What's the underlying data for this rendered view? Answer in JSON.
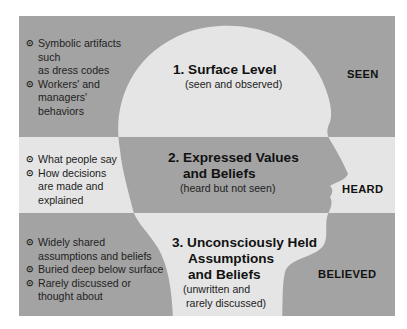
{
  "colors": {
    "dark": "#a3a3a3",
    "light": "#e5e5e5",
    "background": "#ffffff"
  },
  "bullet_icon": "⊙",
  "levels": [
    {
      "title_lines": [
        "1. Surface Level"
      ],
      "subtitle_lines": [
        "(seen and observed)"
      ],
      "tag": "SEEN",
      "bullets": [
        [
          "Symbolic artifacts such",
          "as dress codes"
        ],
        [
          "Workers' and",
          "managers'",
          "behaviors"
        ]
      ]
    },
    {
      "title_lines": [
        "2. Expressed Values",
        "and Beliefs"
      ],
      "subtitle_lines": [
        "(heard but not seen)"
      ],
      "tag": "HEARD",
      "bullets": [
        [
          "What people say"
        ],
        [
          "How decisions",
          "are made and",
          "explained"
        ]
      ]
    },
    {
      "title_lines": [
        "3. Unconsciously Held",
        "Assumptions",
        "and Beliefs"
      ],
      "subtitle_lines": [
        "(unwritten and",
        "rarely discussed)"
      ],
      "tag": "BELIEVED",
      "bullets": [
        [
          "Widely shared",
          "assumptions and beliefs"
        ],
        [
          "Buried deep below surface"
        ],
        [
          "Rarely discussed or",
          "thought about"
        ]
      ]
    }
  ]
}
